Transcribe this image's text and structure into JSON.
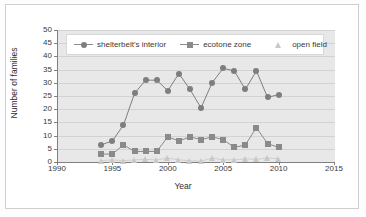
{
  "chart_data": {
    "type": "line",
    "title": "",
    "xlabel": "Year",
    "ylabel": "Number of families",
    "xlim": [
      1990,
      2015
    ],
    "ylim": [
      0,
      50
    ],
    "xticks": [
      1990,
      1995,
      2000,
      2005,
      2010,
      2015
    ],
    "yticks": [
      0,
      5,
      10,
      15,
      20,
      25,
      30,
      35,
      40,
      45,
      50
    ],
    "grid": true,
    "legend_position": "top-inside",
    "x": [
      1994,
      1995,
      1996,
      1997,
      1998,
      1999,
      2000,
      2001,
      2002,
      2003,
      2004,
      2005,
      2006,
      2007,
      2008,
      2009,
      2010
    ],
    "series": [
      {
        "name": "shelterbelt's interior",
        "marker": "circle",
        "color": "#7e7e7e",
        "values": [
          6.5,
          8.0,
          14.0,
          26.0,
          31.0,
          31.0,
          27.0,
          33.5,
          27.5,
          20.5,
          30.0,
          35.5,
          34.5,
          27.5,
          34.5,
          24.5,
          25.5
        ]
      },
      {
        "name": "ecotone zone",
        "marker": "square",
        "color": "#8a8a8a",
        "values": [
          3.0,
          3.0,
          6.5,
          4.0,
          4.0,
          4.0,
          9.5,
          8.0,
          9.5,
          8.5,
          9.5,
          8.5,
          5.5,
          6.5,
          13.0,
          7.0,
          5.5
        ]
      },
      {
        "name": "open field",
        "marker": "triangle",
        "color": "#c8c8c8",
        "values": [
          0.5,
          0.8,
          0.5,
          0.8,
          1.0,
          0.8,
          1.5,
          0.8,
          0.5,
          0.3,
          1.5,
          0.8,
          0.8,
          1.2,
          1.0,
          1.5,
          1.2
        ]
      }
    ]
  },
  "axis": {
    "xticklabels": [
      "1990",
      "1995",
      "2000",
      "2005",
      "2010",
      "2015"
    ],
    "yticklabels": [
      "0",
      "5",
      "10",
      "15",
      "20",
      "25",
      "30",
      "35",
      "40",
      "45",
      "50"
    ],
    "xlabel": "Year",
    "ylabel": "Number of families"
  },
  "legend": {
    "items": [
      {
        "label": "shelterbelt's interior",
        "marker": "circle-marker-icon"
      },
      {
        "label": "ecotone zone",
        "marker": "square-marker-icon"
      },
      {
        "label": "open field",
        "marker": "triangle-marker-icon"
      }
    ]
  },
  "colors": {
    "plot_background": "#e8e8e8",
    "gridline": "#d2d2d2",
    "axis": "#808080",
    "series_1": "#7e7e7e",
    "series_2": "#8a8a8a",
    "series_3": "#c8c8c8",
    "page_background": "#ffffff"
  }
}
